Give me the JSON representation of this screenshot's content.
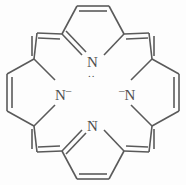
{
  "figure": {
    "name": "porphine-dianion-skeletal-structure",
    "molecule": "porphyrin dianion (porphine 21,23-diide)",
    "colors": {
      "background": "#fdfdfd",
      "bond_stroke": "#5a5a5a",
      "label_text": "#4f4f4f"
    }
  },
  "atoms": {
    "top_nitrogen": {
      "symbol": "N",
      "charge": "",
      "lone_pair": "..",
      "lone_pair_position": "below"
    },
    "bottom_nitrogen": {
      "symbol": "N",
      "charge": "",
      "lone_pair": "..",
      "lone_pair_position": "above"
    },
    "left_nitrogen": {
      "symbol": "N",
      "charge": "–",
      "charge_position": "right",
      "lone_pair": ""
    },
    "right_nitrogen": {
      "symbol": "N",
      "charge": "–",
      "charge_position": "left",
      "lone_pair": ""
    }
  }
}
